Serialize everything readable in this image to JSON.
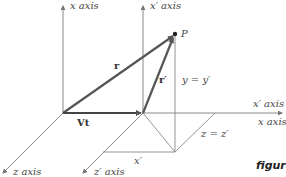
{
  "diagram": {
    "axes": {
      "y_axis": "x axis",
      "y_prime_axis": "x′ axis",
      "x_prime_axis": "x′ axis",
      "x_axis": "x axis",
      "z_axis": "z axis",
      "z_prime_axis": "z′ axis"
    },
    "vectors": {
      "r": "r",
      "r_prime": "r′",
      "vt": "Vt"
    },
    "point": "P",
    "relations": {
      "y_eq": "y = y′",
      "z_eq": "z = z′",
      "x_prime": "x′"
    },
    "caption": "figur",
    "colors": {
      "axis": "#7a7a7a",
      "vector": "#555555",
      "text": "#444444"
    }
  }
}
